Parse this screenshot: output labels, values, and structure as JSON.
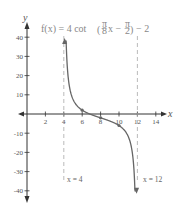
{
  "chart_data": {
    "type": "line",
    "xlabel": "x",
    "ylabel": "y",
    "xlim": [
      -1,
      15
    ],
    "ylim": [
      -45,
      45
    ],
    "x_ticks": [
      2,
      4,
      6,
      8,
      10,
      12,
      14
    ],
    "y_ticks": [
      -40,
      -30,
      -20,
      -10,
      10,
      20,
      30,
      40
    ],
    "grid": false,
    "function": {
      "amplitude": 4,
      "b": 0.39269908,
      "phase": 1.5707963,
      "vertical_shift": -2
    },
    "asymptotes": [
      {
        "x": 4,
        "label": "x = 4"
      },
      {
        "x": 12,
        "label": "x = 12"
      }
    ],
    "marked_points": [
      {
        "x": 6,
        "y": 2
      },
      {
        "x": 8,
        "y": -2
      },
      {
        "x": 10,
        "y": -6
      }
    ],
    "series": [
      {
        "name": "f(x)",
        "x": [
          4.09,
          4.2,
          4.4,
          4.7,
          5,
          5.5,
          6,
          7,
          8,
          9,
          10,
          10.5,
          11,
          11.3,
          11.6,
          11.8,
          11.91
        ],
        "y": [
          36,
          23.4,
          10.7,
          5.5,
          3.3,
          0.6,
          2,
          -0.3,
          -2,
          -3.7,
          -6,
          -8.9,
          -11.7,
          -13.8,
          -23.3,
          -32.6,
          -38
        ]
      }
    ]
  },
  "labels": {
    "title_prefix": "f(x) = 4 cot",
    "title_frac1_num": "π",
    "title_frac1_den": "8",
    "title_mid": "x −",
    "title_frac2_num": "π",
    "title_frac2_den": "2",
    "title_suffix": "− 2",
    "x_axis": "x",
    "y_axis": "y",
    "asym_left": "x = 4",
    "asym_right": "x = 12",
    "xt": [
      "2",
      "4",
      "6",
      "8",
      "10",
      "12",
      "14"
    ],
    "yt": [
      "40",
      "30",
      "20",
      "10",
      "-10",
      "-20",
      "-30",
      "-40"
    ]
  },
  "colors": {
    "curve": "#666666",
    "axis": "#333333",
    "asymptote": "#aaaaaa",
    "text": "#555555"
  }
}
